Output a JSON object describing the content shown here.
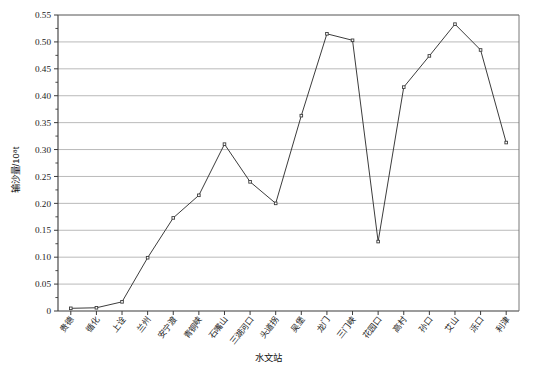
{
  "chart_data": {
    "type": "line",
    "title": "",
    "xlabel": "水文站",
    "ylabel": "输沙量/10⁸t",
    "ylim": [
      0,
      0.55
    ],
    "ytick_step": 0.05,
    "minor_ticks": true,
    "grid": true,
    "legend": null,
    "marker": "open-square",
    "line_color": "#3c3c3c",
    "grid_color": "#a8a8a8",
    "categories": [
      "贵德",
      "循化",
      "上诠",
      "兰州",
      "安宁渡",
      "青铜峡",
      "石嘴山",
      "三湖河口",
      "头道拐",
      "吴堡",
      "龙门",
      "三门峡",
      "花园口",
      "高村",
      "孙口",
      "艾山",
      "泺口",
      "利津"
    ],
    "values": [
      0.005,
      0.006,
      0.017,
      0.099,
      0.173,
      0.215,
      0.31,
      0.24,
      0.2,
      0.363,
      0.515,
      0.503,
      0.129,
      0.416,
      0.474,
      0.533,
      0.485,
      0.313
    ],
    "ytick_labels": [
      "0",
      "0.05",
      "0.10",
      "0.15",
      "0.20",
      "0.25",
      "0.30",
      "0.35",
      "0.40",
      "0.45",
      "0.50",
      "0.55"
    ],
    "ytick_values": [
      0,
      0.05,
      0.1,
      0.15,
      0.2,
      0.25,
      0.3,
      0.35,
      0.4,
      0.45,
      0.5,
      0.55
    ]
  }
}
